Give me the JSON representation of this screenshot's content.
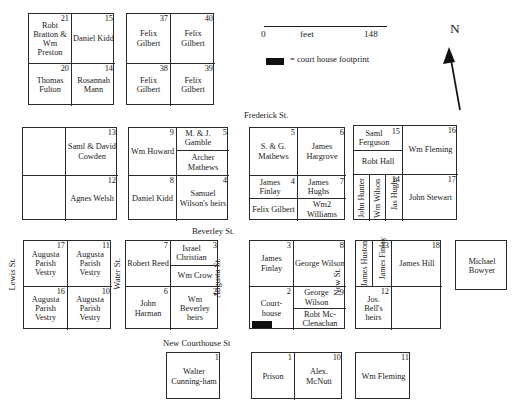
{
  "scale": {
    "min_label": "0",
    "unit_label": "feet",
    "max_label": "148"
  },
  "legend": {
    "text": "= court house footprint"
  },
  "compass": {
    "north_label": "N"
  },
  "streets": [
    {
      "name": "frederick-st",
      "label": "Frederick St."
    },
    {
      "name": "beverley-st",
      "label": "Beverley St."
    },
    {
      "name": "new-courthouse-st",
      "label": "New Courthouse St"
    },
    {
      "name": "lewis-st",
      "label": "Lewis St."
    },
    {
      "name": "water-st",
      "label": "Water St."
    },
    {
      "name": "augusta-st",
      "label": "Augusta St."
    },
    {
      "name": "new-st",
      "label": "New St."
    }
  ],
  "blocks": [
    {
      "name": "block-bratton-kidd",
      "lots": [
        {
          "num": "21",
          "owner": "Robt Bratton & Wm Preston",
          "num_inline": true
        },
        {
          "num": "15",
          "owner": "Daniel Kidd"
        },
        {
          "num": "20",
          "owner": "Thomas Fulton"
        },
        {
          "num": "14",
          "owner": "Rosannah Mann"
        }
      ]
    },
    {
      "name": "block-felix-gilbert",
      "lots": [
        {
          "num": "37",
          "owner": "Felix Gilbert"
        },
        {
          "num": "40",
          "owner": "Felix Gilbert"
        },
        {
          "num": "38",
          "owner": "Felix Gilbert"
        },
        {
          "num": "39",
          "owner": "Felix Gilbert"
        }
      ]
    },
    {
      "name": "block-cowden-welsh",
      "lots": [
        {
          "num": "",
          "owner": ""
        },
        {
          "num": "13",
          "owner": "Saml & David Cowden",
          "num_inline": true
        },
        {
          "num": "",
          "owner": ""
        },
        {
          "num": "12",
          "owner": "Agnes Welsh"
        }
      ]
    },
    {
      "name": "block-howard-gamble",
      "lots": [
        {
          "num": "9",
          "owner": "Wm Howard"
        },
        {
          "num": "5",
          "owner_top": "M. & J. Gamble",
          "owner_bottom": "Archer Mathews",
          "num_inline": true
        },
        {
          "num": "8",
          "owner": "Daniel Kidd"
        },
        {
          "num": "4",
          "owner": "Samuel Wilson's heirs"
        }
      ]
    },
    {
      "name": "block-mathews-hargrove",
      "lots": [
        {
          "num": "5",
          "owner": "S. & G. Mathews"
        },
        {
          "num": "6",
          "owner": "James Hargrove"
        },
        {
          "num": "4",
          "owner_top": "James Finlay",
          "owner_bottom": "Felix Gilbert",
          "num_inline": true
        },
        {
          "num": "7",
          "owner_top": "James Hughs",
          "owner_bottom": "Wm2 Williams",
          "num_inline": true
        }
      ]
    },
    {
      "name": "block-ferguson-fleming",
      "lots": [
        {
          "num": "15",
          "owner_top": "Saml Ferguson",
          "owner_bottom": "Robt Hall",
          "num_inline": true
        },
        {
          "num": "16",
          "owner": "Wm Fleming"
        },
        {
          "num": "14",
          "owners_vertical": [
            "John Hunter",
            "Wm Wilson",
            "Jas Hughs"
          ]
        },
        {
          "num": "17",
          "owner": "John Stewart"
        }
      ]
    },
    {
      "name": "block-augusta-parish-vestry",
      "lots": [
        {
          "num": "17",
          "owner": "Augusta Parish Vestry"
        },
        {
          "num": "11",
          "owner": "Augusta Parish Vestry"
        },
        {
          "num": "16",
          "owner": "Augusta Parish Vestry"
        },
        {
          "num": "10",
          "owner": "Augusta Parish Vestry"
        }
      ]
    },
    {
      "name": "block-reed-harman",
      "lots": [
        {
          "num": "7",
          "owner": "Robert Reed"
        },
        {
          "num": "3",
          "owner_top": "Israel Christian",
          "owner_bottom": "Wm Crow",
          "num_inline": true
        },
        {
          "num": "6",
          "owner": "John Harman"
        },
        {
          "num": "2",
          "owner": "Wm Beverley heirs"
        }
      ]
    },
    {
      "name": "block-courthouse",
      "lots": [
        {
          "num": "3",
          "owner": "James Finlay"
        },
        {
          "num": "8",
          "owner": "George Wilson"
        },
        {
          "num": "2",
          "owner": "Court-house"
        },
        {
          "num": "9",
          "owner_top": "George Wilson",
          "owner_bottom": "Robt Mc-Clenachan",
          "num_inline": true
        }
      ]
    },
    {
      "name": "block-huston-hill",
      "lots": [
        {
          "num": "",
          "owners_vertical": [
            "James Huston"
          ]
        },
        {
          "num": "13",
          "owners_vertical": [
            "James Finlay"
          ]
        },
        {
          "num": "18",
          "owner": "James Hill"
        },
        {
          "num": "12",
          "owner": "Jos. Bell's heirs"
        },
        {
          "num": "",
          "owner": ""
        }
      ]
    },
    {
      "name": "block-michael-bowyer",
      "lots": [
        {
          "num": "",
          "owner": "Michael Bowyer"
        }
      ]
    },
    {
      "name": "block-walter-cunningham",
      "lots": [
        {
          "num": "1",
          "owner": "Walter Cunning-ham",
          "num_inline": true
        }
      ]
    },
    {
      "name": "block-prison-mcnutt",
      "lots": [
        {
          "num": "1",
          "owner": "Prison"
        },
        {
          "num": "10",
          "owner": "Alex. McNutt"
        }
      ]
    },
    {
      "name": "block-wm-fleming-south",
      "lots": [
        {
          "num": "11",
          "owner": "Wm Fleming"
        }
      ]
    }
  ]
}
